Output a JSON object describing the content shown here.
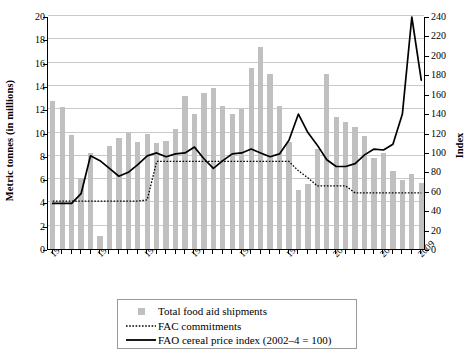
{
  "chart_data": {
    "type": "bar",
    "title": "",
    "xlabel": "",
    "ylabel": "Metric tonnes (in millions)",
    "ylabel_right": "Index",
    "ylim": [
      0,
      20
    ],
    "ylim_right": [
      0,
      240
    ],
    "ytick_step": 2,
    "ytick_step_right": 20,
    "grid": true,
    "legend_position": "bottom-center",
    "x": [
      1970,
      1971,
      1972,
      1973,
      1974,
      1975,
      1976,
      1977,
      1978,
      1979,
      1980,
      1981,
      1982,
      1983,
      1984,
      1985,
      1986,
      1987,
      1988,
      1989,
      1990,
      1991,
      1992,
      1993,
      1994,
      1995,
      1996,
      1997,
      1998,
      1999,
      2000,
      2001,
      2002,
      2003,
      2004,
      2005,
      2006,
      2007,
      2008,
      2009
    ],
    "xticks": [
      "1970",
      "1975",
      "1980",
      "1985",
      "1990",
      "1995",
      "2000",
      "2005",
      "2009"
    ],
    "xtick_years": [
      1970,
      1975,
      1980,
      1985,
      1990,
      1995,
      2000,
      2005,
      2009
    ],
    "yticks_left": [
      "0",
      "2",
      "4",
      "6",
      "8",
      "10",
      "12",
      "14",
      "16",
      "18",
      "20"
    ],
    "yticks_right": [
      "0",
      "20",
      "40",
      "60",
      "80",
      "100",
      "120",
      "140",
      "160",
      "180",
      "200",
      "220",
      "240"
    ],
    "series": [
      {
        "name": "Total food aid shipments",
        "type": "bar",
        "axis": "left",
        "unit": "million metric tonnes",
        "color": "#c0c0c0",
        "values": [
          12.7,
          12.2,
          9.8,
          6.1,
          8.2,
          1.1,
          8.8,
          9.5,
          10.0,
          9.2,
          9.9,
          9.1,
          9.3,
          10.3,
          13.1,
          11.6,
          13.4,
          13.8,
          12.3,
          11.6,
          12.0,
          15.5,
          17.3,
          15.0,
          12.3,
          9.2,
          5.1,
          5.6,
          8.6,
          15.0,
          11.3,
          10.9,
          10.5,
          9.7,
          7.8,
          8.2,
          6.7,
          5.9,
          6.4,
          5.7
        ],
        "values_right_axis_equivalent": [
          152,
          146,
          118,
          73,
          98,
          13,
          106,
          114,
          120,
          110,
          119,
          109,
          112,
          124,
          157,
          139,
          161,
          166,
          148,
          139,
          144,
          186,
          208,
          180,
          148,
          110,
          61,
          67,
          103,
          180,
          136,
          131,
          126,
          116,
          94,
          98,
          80,
          71,
          77,
          68
        ]
      },
      {
        "name": "FAC commitments",
        "type": "line",
        "style": "dotted",
        "axis": "left",
        "unit": "million metric tonnes",
        "color": "#000000",
        "values": [
          4.2,
          4.2,
          4.2,
          4.2,
          4.2,
          4.2,
          4.2,
          4.2,
          4.2,
          4.2,
          4.3,
          7.6,
          7.6,
          7.6,
          7.6,
          7.6,
          7.6,
          7.6,
          7.6,
          7.6,
          7.6,
          7.6,
          7.6,
          7.6,
          7.6,
          7.6,
          6.8,
          6.2,
          5.5,
          5.5,
          5.5,
          5.5,
          4.9,
          4.9,
          4.9,
          4.9,
          4.9,
          4.9,
          4.9,
          4.9
        ]
      },
      {
        "name": "FAO cereal price index (2002–4 = 100)",
        "type": "line",
        "style": "solid",
        "axis": "right",
        "unit": "index (2002-4 = 100)",
        "color": "#000000",
        "values": [
          48,
          48,
          48,
          58,
          97,
          92,
          84,
          76,
          80,
          88,
          97,
          100,
          96,
          99,
          100,
          106,
          94,
          84,
          92,
          99,
          100,
          104,
          100,
          96,
          99,
          113,
          140,
          121,
          108,
          93,
          86,
          86,
          89,
          98,
          104,
          103,
          109,
          140,
          240,
          175
        ]
      }
    ],
    "legend": [
      {
        "label": "Total food aid shipments",
        "marker": "square-swatch"
      },
      {
        "label": "FAC commitments",
        "marker": "dotted-line"
      },
      {
        "label": "FAO cereal price index (2002–4 = 100)",
        "marker": "solid-line"
      }
    ]
  }
}
